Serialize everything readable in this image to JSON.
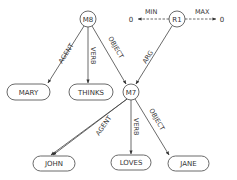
{
  "diagram": {
    "type": "semantic-network",
    "colors": {
      "stroke": "#444444",
      "text": "#333333",
      "background": "#ffffff"
    },
    "nodes": {
      "m8": {
        "label": "M8",
        "shape": "circle"
      },
      "r1": {
        "label": "R1",
        "shape": "circle"
      },
      "m7": {
        "label": "M7",
        "shape": "circle"
      },
      "mary": {
        "label": "MARY",
        "shape": "rounded-rect"
      },
      "thinks": {
        "label": "THINKS",
        "shape": "rounded-rect"
      },
      "john": {
        "label": "JOHN",
        "shape": "rounded-rect"
      },
      "loves": {
        "label": "LOVES",
        "shape": "rounded-rect"
      },
      "jane": {
        "label": "JANE",
        "shape": "rounded-rect"
      },
      "zero_left": {
        "label": "0",
        "shape": "text"
      },
      "zero_right": {
        "label": "0",
        "shape": "text"
      }
    },
    "edges": {
      "m8_mary": {
        "from": "M8",
        "to": "MARY",
        "label": "AGENT",
        "style": "solid"
      },
      "m8_thinks": {
        "from": "M8",
        "to": "THINKS",
        "label": "VERB",
        "style": "solid"
      },
      "m8_m7": {
        "from": "M8",
        "to": "M7",
        "label": "OBJECT",
        "style": "solid"
      },
      "r1_m7": {
        "from": "R1",
        "to": "M7",
        "label": "ARG",
        "style": "solid"
      },
      "r1_min": {
        "from": "R1",
        "to": "0",
        "label": "MIN",
        "style": "dashed"
      },
      "r1_max": {
        "from": "R1",
        "to": "0",
        "label": "MAX",
        "style": "dashed"
      },
      "m7_john": {
        "from": "M7",
        "to": "JOHN",
        "label": "AGENT",
        "style": "solid"
      },
      "m7_loves": {
        "from": "M7",
        "to": "LOVES",
        "label": "VERB",
        "style": "solid"
      },
      "m7_jane": {
        "from": "M7",
        "to": "JANE",
        "label": "OBJECT",
        "style": "solid"
      }
    }
  }
}
